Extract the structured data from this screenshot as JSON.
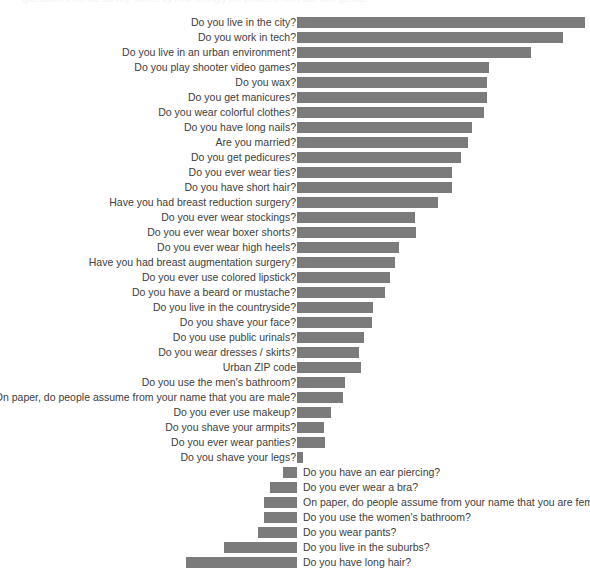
{
  "title_remnant": "Questions from the survey, sorted by how strongly the answers correlate with gender",
  "colors": {
    "bar": "#7b7b7b",
    "label_text": "#3d3d3d",
    "background": "#ffffff"
  },
  "chart_data": {
    "type": "bar",
    "orientation": "horizontal",
    "title": "",
    "xlabel": "",
    "ylabel": "",
    "grid": false,
    "legend": null,
    "baseline_x_px": 297,
    "note": "Diverging horizontal bar chart. Positive (male-leaning) bars extend right from the baseline with labels at left; negative (female-leaning) bars extend left from the baseline with labels at right.",
    "categories": [
      "Do you live in the city?",
      "Do you work in tech?",
      "Do you live in an urban environment?",
      "Do you play shooter video games?",
      "Do you wax?",
      "Do you get manicures?",
      "Do you wear colorful clothes?",
      "Do you have long nails?",
      "Are you married?",
      "Do you get pedicures?",
      "Do you ever wear ties?",
      "Do you have short hair?",
      "Have you had breast reduction surgery?",
      "Do you ever wear stockings?",
      "Do you ever wear boxer shorts?",
      "Do you ever wear high heels?",
      "Have you had breast augmentation surgery?",
      "Do you ever use colored lipstick?",
      "Do you have a beard or mustache?",
      "Do you live in the countryside?",
      "Do you shave your face?",
      "Do you use public urinals?",
      "Do you wear dresses / skirts?",
      "Urban ZIP code",
      "Do you use the men's bathroom?",
      "On paper, do people assume from your name that you are male?",
      "Do you ever use makeup?",
      "Do you shave your armpits?",
      "Do you ever wear panties?",
      "Do you shave your legs?",
      "Do you have an ear piercing?",
      "Do you ever wear a bra?",
      "On paper, do people assume from your name that you are female?",
      "Do you use the women's bathroom?",
      "Do you wear pants?",
      "Do you live in the suburbs?",
      "Do you have long hair?"
    ],
    "values": [
      288,
      266,
      234,
      192,
      190,
      190,
      187,
      175,
      171,
      164,
      155,
      155,
      141,
      118,
      119,
      102,
      98,
      93,
      88,
      76,
      75,
      67,
      62,
      64,
      48,
      46,
      34,
      27,
      28,
      6,
      -14,
      -27,
      -33,
      -33,
      -39,
      -73,
      -111
    ],
    "value_unit": "px (bar length from baseline)",
    "rows": [
      {
        "label": "Do you live in the city?",
        "value": 288,
        "side": "positive"
      },
      {
        "label": "Do you work in tech?",
        "value": 266,
        "side": "positive"
      },
      {
        "label": "Do you live in an urban environment?",
        "value": 234,
        "side": "positive"
      },
      {
        "label": "Do you play shooter video games?",
        "value": 192,
        "side": "positive"
      },
      {
        "label": "Do you wax?",
        "value": 190,
        "side": "positive"
      },
      {
        "label": "Do you get manicures?",
        "value": 190,
        "side": "positive"
      },
      {
        "label": "Do you wear colorful clothes?",
        "value": 187,
        "side": "positive"
      },
      {
        "label": "Do you have long nails?",
        "value": 175,
        "side": "positive"
      },
      {
        "label": "Are you married?",
        "value": 171,
        "side": "positive"
      },
      {
        "label": "Do you get pedicures?",
        "value": 164,
        "side": "positive"
      },
      {
        "label": "Do you ever wear ties?",
        "value": 155,
        "side": "positive"
      },
      {
        "label": "Do you have short hair?",
        "value": 155,
        "side": "positive"
      },
      {
        "label": "Have you had breast reduction surgery?",
        "value": 141,
        "side": "positive"
      },
      {
        "label": "Do you ever wear stockings?",
        "value": 118,
        "side": "positive"
      },
      {
        "label": "Do you ever wear boxer shorts?",
        "value": 119,
        "side": "positive"
      },
      {
        "label": "Do you ever wear high heels?",
        "value": 102,
        "side": "positive"
      },
      {
        "label": "Have you had breast augmentation surgery?",
        "value": 98,
        "side": "positive"
      },
      {
        "label": "Do you ever use colored lipstick?",
        "value": 93,
        "side": "positive"
      },
      {
        "label": "Do you have a beard or mustache?",
        "value": 88,
        "side": "positive"
      },
      {
        "label": "Do you live in the countryside?",
        "value": 76,
        "side": "positive"
      },
      {
        "label": "Do you shave your face?",
        "value": 75,
        "side": "positive"
      },
      {
        "label": "Do you use public urinals?",
        "value": 67,
        "side": "positive"
      },
      {
        "label": "Do you wear dresses / skirts?",
        "value": 62,
        "side": "positive"
      },
      {
        "label": "Urban ZIP code",
        "value": 64,
        "side": "positive"
      },
      {
        "label": "Do you use the men's bathroom?",
        "value": 48,
        "side": "positive"
      },
      {
        "label": "On paper, do people assume from your name that you are male?",
        "value": 46,
        "side": "positive"
      },
      {
        "label": "Do you ever use makeup?",
        "value": 34,
        "side": "positive"
      },
      {
        "label": "Do you shave your armpits?",
        "value": 27,
        "side": "positive"
      },
      {
        "label": "Do you ever wear panties?",
        "value": 28,
        "side": "positive"
      },
      {
        "label": "Do you shave your legs?",
        "value": 6,
        "side": "positive"
      },
      {
        "label": "Do you have an ear piercing?",
        "value": -14,
        "side": "negative"
      },
      {
        "label": "Do you ever wear a bra?",
        "value": -27,
        "side": "negative"
      },
      {
        "label": "On paper, do people assume from your name that you are female?",
        "value": -33,
        "side": "negative"
      },
      {
        "label": "Do you use the women's bathroom?",
        "value": -33,
        "side": "negative"
      },
      {
        "label": "Do you wear pants?",
        "value": -39,
        "side": "negative"
      },
      {
        "label": "Do you live in the suburbs?",
        "value": -73,
        "side": "negative"
      },
      {
        "label": "Do you have long hair?",
        "value": -111,
        "side": "negative"
      }
    ]
  }
}
